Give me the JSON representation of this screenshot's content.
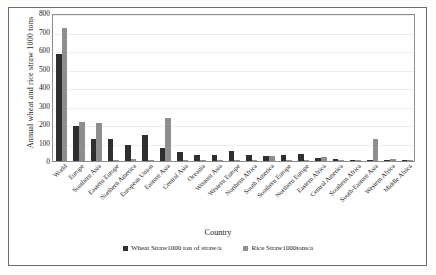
{
  "chart_data": {
    "type": "bar",
    "title": "",
    "xlabel": "Country",
    "ylabel": "Annual wheat and rice straw  1000 tons",
    "ylim": [
      0,
      800
    ],
    "yticks": [
      0,
      100,
      200,
      300,
      400,
      500,
      600,
      700,
      800
    ],
    "grid": true,
    "legend_position": "bottom",
    "categories": [
      "World",
      "Europe",
      "Southern Asia",
      "Eastern Europe",
      "Northern America",
      "European Union",
      "Eastern Asia",
      "Central Asia",
      "Oceania",
      "Western Asia",
      "Western Europe",
      "Northern Africa",
      "South America",
      "Southern Europe",
      "Northern Europe",
      "Eastern Africa",
      "Central America",
      "Southern Africa",
      "South-Eastern Asia",
      "Western Africa",
      "Middle Africa"
    ],
    "series": [
      {
        "name": "Wheat Straw1000 ton of straw/a",
        "color": "#2f2f2f",
        "values": [
          580,
          190,
          120,
          120,
          85,
          140,
          72,
          47,
          33,
          30,
          56,
          32,
          27,
          35,
          38,
          14,
          9,
          6,
          4,
          2,
          1
        ]
      },
      {
        "name": "Rice Straw1000tons/a",
        "color": "#8e8e8e",
        "values": [
          720,
          210,
          205,
          8,
          10,
          7,
          230,
          2,
          2,
          3,
          1,
          6,
          27,
          2,
          1,
          22,
          3,
          2,
          120,
          12,
          1
        ]
      }
    ]
  },
  "legend": {
    "items": [
      {
        "label": "Wheat Straw1000 ton of straw/a"
      },
      {
        "label": "Rice Straw1000tons/a"
      }
    ]
  },
  "colors": {
    "wheat": "#2f2f2f",
    "rice": "#8e8e8e",
    "grid": "#ededed",
    "frame": "#6b6b6b",
    "plot_border": "#8d8d8d"
  }
}
